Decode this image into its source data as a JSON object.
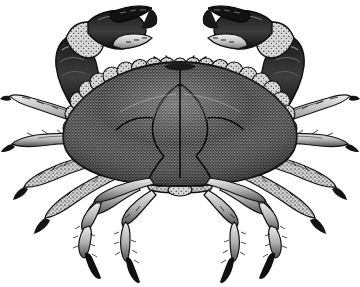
{
  "image": {
    "kind": "engraving-illustration",
    "subject": "crab",
    "common_name": "Edible Crab",
    "style": "vintage woodcut stipple engraving",
    "background_color": "#ffffff",
    "ink_color": "#111111",
    "midtone_color": "#6b6b6b",
    "highlight_color": "#e8e8e8",
    "width_px": 360,
    "height_px": 287,
    "has_text": false,
    "caption": ""
  },
  "anatomy": {
    "carapace": {
      "label": "carapace",
      "shape": "broad oval dome",
      "texture": "dense stipple",
      "margin": "scalloped lobes",
      "lobe_count": 22,
      "center_x": 180,
      "center_y": 130,
      "width": 250,
      "height": 130
    },
    "eyes": {
      "label": "eyestalks",
      "count": 2
    },
    "antennae": {
      "label": "antennae",
      "count": 4,
      "shape": "slender curved"
    },
    "chelae": [
      {
        "label": "left-claw",
        "side": "left",
        "raised": true
      },
      {
        "label": "right-claw",
        "side": "right",
        "raised": true
      }
    ],
    "walking_legs": {
      "label": "walking legs",
      "pairs": 4,
      "total": 8,
      "features": "segmented, bristled, dark curved dactyl tips"
    },
    "abdomen": {
      "label": "abdomen",
      "visible": true
    }
  },
  "palette": {
    "black": "#111111",
    "dark": "#2b2b2b",
    "shell_dark": "#3a3a3a",
    "shell_mid": "#7a7a7a",
    "shell_light": "#c9c9c9",
    "highlight": "#efefef",
    "white": "#ffffff"
  }
}
